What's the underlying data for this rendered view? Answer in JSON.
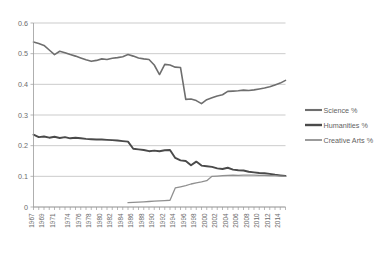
{
  "chart_data": {
    "type": "line",
    "title": "",
    "xlabel": "",
    "ylabel": "",
    "ylim": [
      0,
      0.6
    ],
    "xlim": [
      1967,
      2015
    ],
    "grid": true,
    "legend_position": "right",
    "ytick_labels": [
      "0",
      "0.1",
      "0.2",
      "0.3",
      "0.4",
      "0.5",
      "0.6"
    ],
    "ytick_values": [
      0,
      0.1,
      0.2,
      0.3,
      0.4,
      0.5,
      0.6
    ],
    "xtick_labels": [
      "1967",
      "1969",
      "1971",
      "1974",
      "1976",
      "1978",
      "1980",
      "1982",
      "1984",
      "1986",
      "1988",
      "1990",
      "1992",
      "1994",
      "1996",
      "1998",
      "2000",
      "2002",
      "2004",
      "2006",
      "2008",
      "2010",
      "2012",
      "2014"
    ],
    "x": [
      1967,
      1968,
      1969,
      1970,
      1971,
      1972,
      1973,
      1974,
      1975,
      1976,
      1977,
      1978,
      1979,
      1980,
      1981,
      1982,
      1983,
      1984,
      1985,
      1986,
      1987,
      1988,
      1989,
      1990,
      1991,
      1992,
      1993,
      1994,
      1995,
      1996,
      1997,
      1998,
      1999,
      2000,
      2001,
      2002,
      2003,
      2004,
      2005,
      2006,
      2007,
      2008,
      2009,
      2010,
      2011,
      2012,
      2013,
      2014,
      2015
    ],
    "series": [
      {
        "name": "Science %",
        "color": "#6e6e6e",
        "width": 1.6,
        "values": [
          0.538,
          0.533,
          0.527,
          0.512,
          0.497,
          0.508,
          0.503,
          0.497,
          0.492,
          0.486,
          0.48,
          0.475,
          0.478,
          0.483,
          0.481,
          0.485,
          0.487,
          0.49,
          0.497,
          0.492,
          0.486,
          0.483,
          0.481,
          0.463,
          0.432,
          0.465,
          0.463,
          0.456,
          0.455,
          0.351,
          0.352,
          0.347,
          0.337,
          0.35,
          0.356,
          0.362,
          0.366,
          0.377,
          0.378,
          0.379,
          0.381,
          0.38,
          0.382,
          0.385,
          0.388,
          0.392,
          0.398,
          0.404,
          0.413
        ]
      },
      {
        "name": "Humanities %",
        "color": "#4a4a4a",
        "width": 1.9,
        "values": [
          0.236,
          0.228,
          0.23,
          0.226,
          0.229,
          0.225,
          0.228,
          0.224,
          0.226,
          0.224,
          0.222,
          0.221,
          0.22,
          0.22,
          0.219,
          0.218,
          0.217,
          0.215,
          0.213,
          0.19,
          0.188,
          0.186,
          0.182,
          0.184,
          0.182,
          0.185,
          0.186,
          0.16,
          0.152,
          0.15,
          0.136,
          0.148,
          0.135,
          0.133,
          0.131,
          0.126,
          0.124,
          0.128,
          0.122,
          0.12,
          0.119,
          0.115,
          0.113,
          0.111,
          0.11,
          0.108,
          0.105,
          0.103,
          0.101
        ]
      },
      {
        "name": "Creative Arts %",
        "color": "#909090",
        "width": 1.3,
        "values": [
          null,
          null,
          null,
          null,
          null,
          null,
          null,
          null,
          null,
          null,
          null,
          null,
          null,
          null,
          null,
          null,
          null,
          null,
          0.014,
          0.015,
          0.016,
          0.017,
          0.018,
          0.019,
          0.02,
          0.021,
          0.022,
          0.062,
          0.066,
          0.07,
          0.075,
          0.079,
          0.082,
          0.086,
          0.1,
          0.101,
          0.102,
          0.103,
          0.104,
          0.103,
          0.104,
          0.104,
          0.104,
          0.103,
          0.103,
          0.102,
          0.102,
          0.101,
          0.1
        ]
      }
    ]
  },
  "legend": {
    "items": [
      {
        "label": "Science %"
      },
      {
        "label": "Humanities %"
      },
      {
        "label": "Creative Arts %"
      }
    ]
  }
}
